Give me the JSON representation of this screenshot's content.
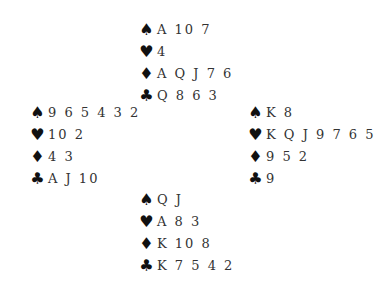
{
  "suits": {
    "spades": "♠",
    "hearts": "♥",
    "diamonds": "♦",
    "clubs": "♣"
  },
  "hands": {
    "north": {
      "spades": "A 10 7",
      "hearts": "4",
      "diamonds": "A Q J 7 6",
      "clubs": "Q 8 6 3"
    },
    "west": {
      "spades": "9 6 5 4 3 2",
      "hearts": "10 2",
      "diamonds": "4 3",
      "clubs": "A J 10"
    },
    "east": {
      "spades": "K 8",
      "hearts": "K Q J 9 7 6 5",
      "diamonds": "9 5 2",
      "clubs": "9"
    },
    "south": {
      "spades": "Q J",
      "hearts": "A 8 3",
      "diamonds": "K 10 8",
      "clubs": "K 7 5 4 2"
    }
  }
}
